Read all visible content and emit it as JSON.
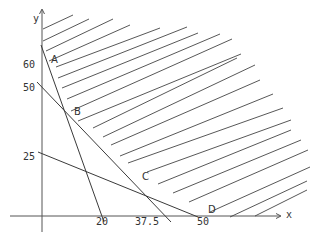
{
  "diagram": {
    "type": "linear-programming-feasible-region",
    "axes": {
      "x_label": "x",
      "y_label": "y"
    },
    "y_ticks": [
      "60",
      "50",
      "25"
    ],
    "x_ticks": [
      "20",
      "37.5",
      "50"
    ],
    "vertices": [
      "A",
      "B",
      "C",
      "D"
    ],
    "constraint_lines": [
      {
        "y_intercept": "60",
        "x_intercept": "20"
      },
      {
        "y_intercept": "50",
        "x_intercept": "37.5"
      },
      {
        "y_intercept": "25",
        "x_intercept": "50"
      }
    ],
    "shading": "hatched region above/right of boundary A-B-C-D",
    "colors": {
      "ink": "#3a3a3a",
      "background": "#ffffff"
    }
  }
}
